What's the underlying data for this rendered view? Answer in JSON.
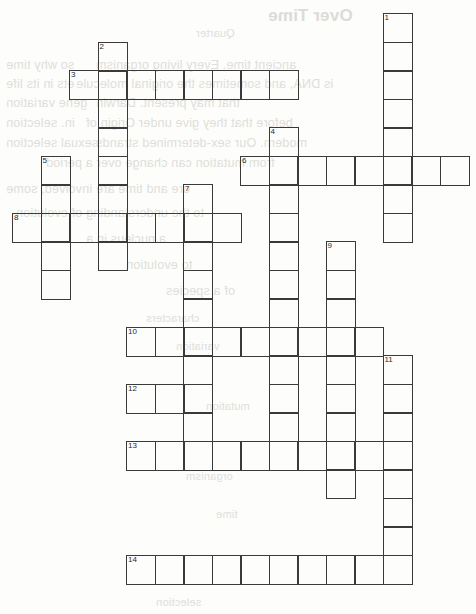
{
  "document": {
    "type": "crossword-puzzle-grid",
    "title_bleed": "Over Time",
    "background_color": "#fdfdfb",
    "grid_line_color": "#3a3a3a",
    "number_color": "#2b2b2b"
  },
  "grid": {
    "cell_size": 28.5,
    "origin_x": 12,
    "origin_y": 13,
    "columns": 16,
    "rows": 21,
    "entries": [
      {
        "number": "1",
        "direction": "down",
        "col": 13,
        "row": 0,
        "length": 8
      },
      {
        "number": "2",
        "direction": "down",
        "col": 3,
        "row": 1,
        "length": 8
      },
      {
        "number": "3",
        "direction": "across",
        "col": 2,
        "row": 2,
        "length": 8
      },
      {
        "number": "4",
        "direction": "down",
        "col": 9,
        "row": 4,
        "length": 11
      },
      {
        "number": "5",
        "direction": "down",
        "col": 1,
        "row": 5,
        "length": 5
      },
      {
        "number": "6",
        "direction": "across",
        "col": 8,
        "row": 5,
        "length": 8
      },
      {
        "number": "7",
        "direction": "down",
        "col": 6,
        "row": 6,
        "length": 10
      },
      {
        "number": "8",
        "direction": "across",
        "col": 0,
        "row": 7,
        "length": 8
      },
      {
        "number": "9",
        "direction": "down",
        "col": 11,
        "row": 8,
        "length": 9
      },
      {
        "number": "10",
        "direction": "across",
        "col": 4,
        "row": 11,
        "length": 9
      },
      {
        "number": "11",
        "direction": "down",
        "col": 13,
        "row": 12,
        "length": 8
      },
      {
        "number": "12",
        "direction": "across",
        "col": 4,
        "row": 13,
        "length": 3
      },
      {
        "number": "13",
        "direction": "across",
        "col": 4,
        "row": 15,
        "length": 10
      },
      {
        "number": "14",
        "direction": "across",
        "col": 4,
        "row": 19,
        "length": 10
      }
    ],
    "numbered_cells": [
      {
        "number": "1",
        "col": 13,
        "row": 0
      },
      {
        "number": "2",
        "col": 3,
        "row": 1
      },
      {
        "number": "3",
        "col": 2,
        "row": 2
      },
      {
        "number": "4",
        "col": 9,
        "row": 4
      },
      {
        "number": "5",
        "col": 1,
        "row": 5
      },
      {
        "number": "6",
        "col": 8,
        "row": 5
      },
      {
        "number": "7",
        "col": 6,
        "row": 6
      },
      {
        "number": "8",
        "col": 0,
        "row": 7
      },
      {
        "number": "9",
        "col": 11,
        "row": 8
      },
      {
        "number": "10",
        "col": 4,
        "row": 11
      },
      {
        "number": "11",
        "col": 13,
        "row": 12
      },
      {
        "number": "12",
        "col": 4,
        "row": 13
      },
      {
        "number": "13",
        "col": 4,
        "row": 15
      },
      {
        "number": "14",
        "col": 4,
        "row": 19
      }
    ]
  },
  "bleed_through": {
    "title": "Over Time",
    "lines": [
      {
        "text": "Over Time",
        "x": 268,
        "y": 6,
        "size": "title"
      },
      {
        "text": "Quarter",
        "x": 196,
        "y": 27,
        "size": "small"
      },
      {
        "text": "so why time",
        "x": 6,
        "y": 58,
        "size": "body"
      },
      {
        "text": "ancient time. Every living organism",
        "x": 96,
        "y": 58,
        "size": "body"
      },
      {
        "text": "ets in its life",
        "x": 6,
        "y": 77,
        "size": "body"
      },
      {
        "text": "is DNA, and sometimes the original molecule",
        "x": 76,
        "y": 77,
        "size": "body"
      },
      {
        "text": "gene variation",
        "x": 6,
        "y": 96,
        "size": "body"
      },
      {
        "text": "that may present. Darwin",
        "x": 96,
        "y": 96,
        "size": "body"
      },
      {
        "text": "in. selection",
        "x": 6,
        "y": 116,
        "size": "body"
      },
      {
        "text": "before that they give under Origin of",
        "x": 86,
        "y": 116,
        "size": "body"
      },
      {
        "text": "sexual selection",
        "x": 6,
        "y": 136,
        "size": "body"
      },
      {
        "text": "modern. Our sex-determined strands",
        "x": 96,
        "y": 136,
        "size": "body"
      },
      {
        "text": "from mutation can change over a period",
        "x": 46,
        "y": 156,
        "size": "body"
      },
      {
        "text": "ore and time are involved, some",
        "x": 6,
        "y": 182,
        "size": "body"
      },
      {
        "text": "to the understanding of evolution",
        "x": 16,
        "y": 206,
        "size": "body"
      },
      {
        "text": "a nucleus in a",
        "x": 86,
        "y": 232,
        "size": "body"
      },
      {
        "text": "to evolution",
        "x": 126,
        "y": 258,
        "size": "body"
      },
      {
        "text": "of a species",
        "x": 166,
        "y": 284,
        "size": "body"
      },
      {
        "text": "characters",
        "x": 146,
        "y": 312,
        "size": "small"
      },
      {
        "text": "variation",
        "x": 176,
        "y": 340,
        "size": "small"
      },
      {
        "text": "mutation",
        "x": 206,
        "y": 400,
        "size": "small"
      },
      {
        "text": "organism",
        "x": 186,
        "y": 470,
        "size": "small"
      },
      {
        "text": "time",
        "x": 216,
        "y": 508,
        "size": "small"
      },
      {
        "text": "selection",
        "x": 156,
        "y": 596,
        "size": "small"
      }
    ]
  }
}
